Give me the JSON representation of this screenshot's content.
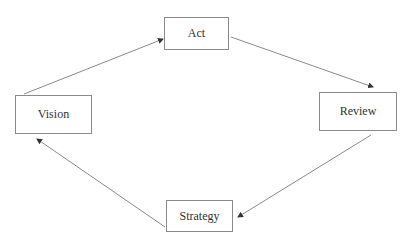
{
  "diagram": {
    "type": "cycle",
    "nodes": [
      {
        "id": "act",
        "label": "Act",
        "x": 164,
        "y": 17,
        "w": 65,
        "h": 33
      },
      {
        "id": "review",
        "label": "Review",
        "x": 319,
        "y": 92,
        "w": 78,
        "h": 39
      },
      {
        "id": "strategy",
        "label": "Strategy",
        "x": 166,
        "y": 200,
        "w": 67,
        "h": 32
      },
      {
        "id": "vision",
        "label": "Vision",
        "x": 15,
        "y": 95,
        "w": 77,
        "h": 39
      }
    ],
    "edges": [
      {
        "from": "vision",
        "to": "act"
      },
      {
        "from": "act",
        "to": "review"
      },
      {
        "from": "review",
        "to": "strategy"
      },
      {
        "from": "strategy",
        "to": "vision"
      }
    ]
  },
  "colors": {
    "line": "#8a8a8a",
    "arrowhead": "#333333",
    "text": "#333333"
  }
}
